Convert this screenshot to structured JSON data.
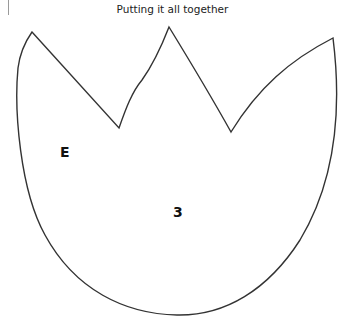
{
  "title": "Putting it all together",
  "shape": {
    "description": "tulip / crown outline with three peaks and rounded bottom",
    "stroke_color": "#333333",
    "fill_color": "#ffffff",
    "vertices": {
      "left_peak": [
        32,
        32
      ],
      "left_valley": [
        119,
        128
      ],
      "middle_peak": [
        169,
        27
      ],
      "right_valley": [
        231,
        132
      ],
      "right_peak": [
        333,
        38
      ],
      "bottom": [
        177,
        315
      ]
    }
  },
  "labels": [
    {
      "id": "region-E",
      "text": "E",
      "x": 60,
      "y": 146
    },
    {
      "id": "region-3",
      "text": "3",
      "x": 173,
      "y": 206
    }
  ]
}
